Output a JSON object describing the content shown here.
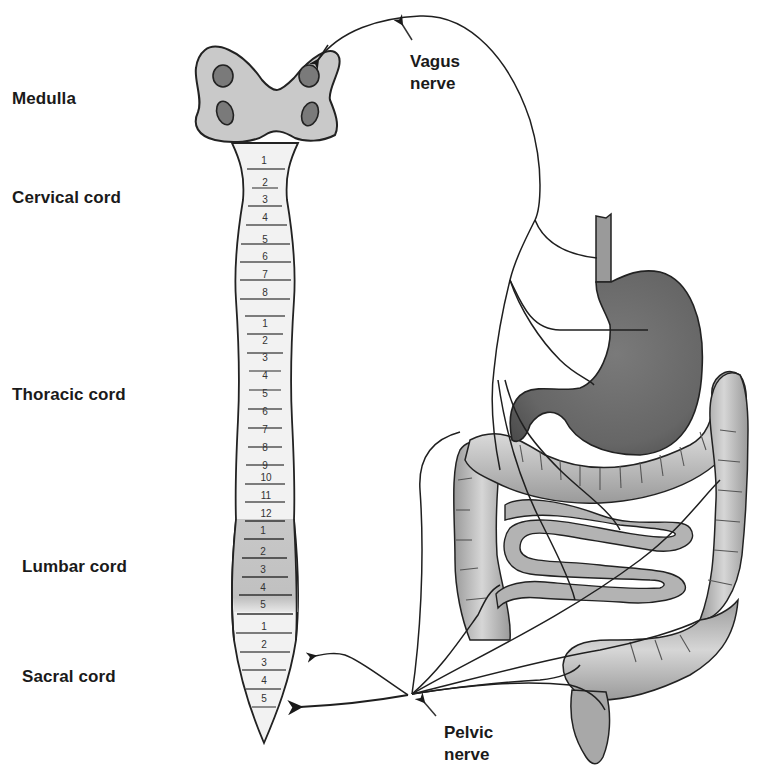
{
  "diagram": {
    "region_labels": [
      {
        "id": "medulla",
        "text": "Medulla"
      },
      {
        "id": "cervical",
        "text": "Cervical cord"
      },
      {
        "id": "thoracic",
        "text": "Thoracic cord"
      },
      {
        "id": "lumbar",
        "text": "Lumbar cord"
      },
      {
        "id": "sacral",
        "text": "Sacral  cord"
      }
    ],
    "nerve_labels": {
      "vagus": {
        "line1": "Vagus",
        "line2": "nerve"
      },
      "pelvic": {
        "line1": "Pelvic",
        "line2": "nerve"
      }
    },
    "spinal_segments": {
      "cervical": [
        "1",
        "2",
        "3",
        "4",
        "5",
        "6",
        "7",
        "8"
      ],
      "thoracic": [
        "1",
        "2",
        "3",
        "4",
        "5",
        "6",
        "7",
        "8",
        "9",
        "10",
        "11",
        "12"
      ],
      "lumbar": [
        "1",
        "2",
        "3",
        "4",
        "5"
      ],
      "sacral": [
        "1",
        "2",
        "3",
        "4",
        "5"
      ]
    },
    "colors": {
      "outline": "#222222",
      "medulla_fill": "#c9c9c9",
      "nuclei_fill": "#7a7a7a",
      "cord_fill": "#f2f2f2",
      "lumbar_fill": "#c4c4c4",
      "stomach_fill": "#6e6e6e",
      "intestine_fill": "#b3b3b3"
    }
  }
}
